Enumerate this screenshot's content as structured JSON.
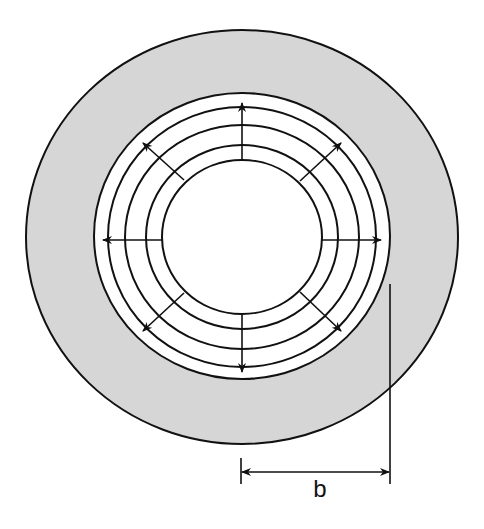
{
  "diagram": {
    "type": "concentric-cross-section",
    "colors": {
      "background": "#ffffff",
      "shaded_annulus": "#d6d6d6",
      "stroke": "#111111"
    },
    "center": {
      "x": 242,
      "y": 237
    },
    "outer_boundary": {
      "rx": 216,
      "ry": 207
    },
    "rings": [
      {
        "name": "ring-1",
        "rx": 148,
        "ry": 143
      },
      {
        "name": "ring-2",
        "rx": 134,
        "ry": 130
      },
      {
        "name": "ring-3",
        "rx": 117,
        "ry": 112
      },
      {
        "name": "ring-4",
        "rx": 96,
        "ry": 92
      },
      {
        "name": "ring-5",
        "rx": 80,
        "ry": 77
      }
    ],
    "arrows": [
      {
        "direction": "up",
        "x1": 242,
        "y1": 160,
        "x2": 242,
        "y2": 103
      },
      {
        "direction": "down",
        "x1": 242,
        "y1": 314,
        "x2": 242,
        "y2": 372
      },
      {
        "direction": "left",
        "x1": 162,
        "y1": 240,
        "x2": 103,
        "y2": 240
      },
      {
        "direction": "right",
        "x1": 322,
        "y1": 240,
        "x2": 381,
        "y2": 240
      },
      {
        "direction": "up-left",
        "x1": 184,
        "y1": 180,
        "x2": 143,
        "y2": 143
      },
      {
        "direction": "up-right",
        "x1": 300,
        "y1": 181,
        "x2": 341,
        "y2": 143
      },
      {
        "direction": "down-left",
        "x1": 184,
        "y1": 293,
        "x2": 143,
        "y2": 331
      },
      {
        "direction": "down-right",
        "x1": 300,
        "y1": 292,
        "x2": 341,
        "y2": 331
      }
    ],
    "dimension": {
      "label": "b",
      "left_tick": {
        "x": 241,
        "y1": 458,
        "y2": 484
      },
      "right_line": {
        "x": 390,
        "y1": 284,
        "y2": 484
      },
      "arrow_y": 472,
      "label_x": 320,
      "label_y": 497
    }
  }
}
